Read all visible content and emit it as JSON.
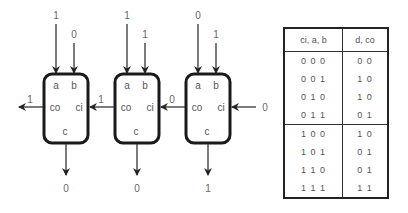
{
  "blocks": [
    {
      "labels": {
        "a": "a",
        "b": "b",
        "co": "co",
        "ci": "ci",
        "c": "c"
      },
      "inputs": {
        "a": "1",
        "b": "0"
      },
      "carry_out": "1",
      "output_c": "0"
    },
    {
      "labels": {
        "a": "a",
        "b": "b",
        "co": "co",
        "ci": "ci",
        "c": "c"
      },
      "inputs": {
        "a": "1",
        "b": "1"
      },
      "carry_out": "1",
      "output_c": "0"
    },
    {
      "labels": {
        "a": "a",
        "b": "b",
        "co": "co",
        "ci": "ci",
        "c": "c"
      },
      "inputs": {
        "a": "0",
        "b": "1"
      },
      "carry_out": "0",
      "carry_in": "0",
      "output_c": "1"
    }
  ],
  "truth_table": {
    "headers": [
      "ci, a, b",
      "d, co"
    ],
    "rows": [
      [
        "0 0 0",
        "0 0"
      ],
      [
        "0 0 1",
        "1 0"
      ],
      [
        "0 1 0",
        "1 0"
      ],
      [
        "0 1 1",
        "0 1"
      ],
      [
        "1 0 0",
        "1 0"
      ],
      [
        "1 0 1",
        "0 1"
      ],
      [
        "1 1 0",
        "0 1"
      ],
      [
        "1 1 1",
        "1 1"
      ]
    ]
  },
  "colors": {
    "stroke": "#1a1a1a",
    "arrow": "#333333",
    "text": "#555555"
  }
}
